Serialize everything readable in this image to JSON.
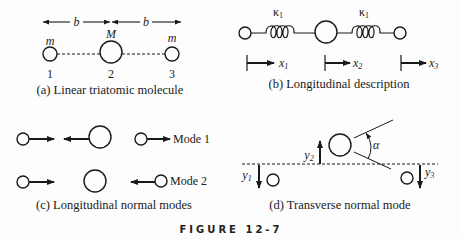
{
  "figure": {
    "title": "FIGURE 12-7",
    "ink_color": "#1a1a1a",
    "background": "#fdfdfd"
  },
  "panel_a": {
    "caption": "(a) Linear triatomic molecule",
    "spacing_label_left": "b",
    "spacing_label_right": "b",
    "mass_labels": [
      "m",
      "M",
      "m"
    ],
    "atom_numbers": [
      "1",
      "2",
      "3"
    ]
  },
  "panel_b": {
    "caption": "(b) Longitudinal description",
    "spring_labels": [
      "κ",
      "κ"
    ],
    "spring_label_subscripts": [
      "1",
      "1"
    ],
    "displacements": [
      {
        "var": "x",
        "sub": "1"
      },
      {
        "var": "x",
        "sub": "2"
      },
      {
        "var": "x",
        "sub": "3"
      }
    ]
  },
  "panel_c": {
    "caption": "(c) Longitudinal normal modes",
    "modes": [
      "Mode 1",
      "Mode 2"
    ]
  },
  "panel_d": {
    "caption": "(d) Transverse normal mode",
    "displacements": [
      {
        "var": "y",
        "sub": "1"
      },
      {
        "var": "y",
        "sub": "2"
      },
      {
        "var": "y",
        "sub": "3"
      }
    ],
    "angle_label": "α"
  }
}
